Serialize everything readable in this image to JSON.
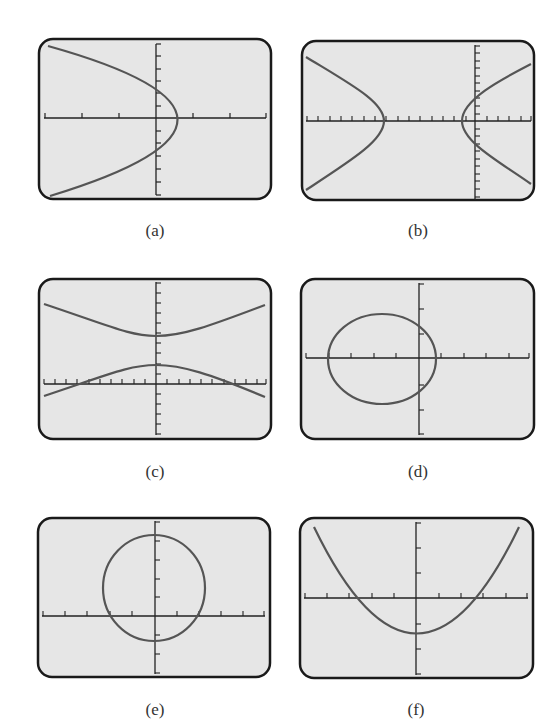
{
  "colors": {
    "screen_bg": "#e6e6e6",
    "frame": "#1a1a1a",
    "curve": "#555555",
    "axis": "#222222"
  },
  "panels": [
    {
      "id": "a",
      "label": "(a)",
      "shape": "parabola opening left",
      "frame": {
        "x": 38,
        "y": 38,
        "w": 234,
        "h": 162
      },
      "axis_origin": {
        "x": 156,
        "y": 118
      },
      "x_tick_spacing": 37,
      "y_tick_spacing": 12.3,
      "curve_path": "M 48 46 Q 306 118 48 196"
    },
    {
      "id": "b",
      "label": "(b)",
      "shape": "hyperbola opening left/right",
      "frame": {
        "x": 301,
        "y": 40,
        "w": 234,
        "h": 161
      },
      "axis_origin": {
        "x": 475,
        "y": 121
      },
      "x_tick_spacing": 11.4,
      "y_tick_spacing": 7.6,
      "curve_path": "M 306 57 C 350 85, 384 102, 384 121 C 384 140, 350 160, 306 190 M 531 64 C 500 80, 462 100, 462 121 C 462 142, 500 162, 531 184"
    },
    {
      "id": "c",
      "label": "(c)",
      "shape": "hyperbola opening up/down",
      "frame": {
        "x": 38,
        "y": 278,
        "w": 234,
        "h": 162
      },
      "axis_origin": {
        "x": 156,
        "y": 384
      },
      "x_tick_spacing": 11.3,
      "y_tick_spacing": 10,
      "curve_path": "M 44 304 C 110 326, 130 336, 156 336 C 182 336, 210 326, 265 305 M 44 396 C 110 374, 130 365, 156 365 C 182 365, 210 374, 265 397"
    },
    {
      "id": "d",
      "label": "(d)",
      "shape": "ellipse",
      "frame": {
        "x": 300,
        "y": 278,
        "w": 235,
        "h": 162
      },
      "axis_origin": {
        "x": 419,
        "y": 358
      },
      "x_tick_spacing": 22.5,
      "y_tick_spacing": 25.5,
      "ellipse": {
        "cx": 382,
        "cy": 359,
        "rx": 54,
        "ry": 45
      }
    },
    {
      "id": "e",
      "label": "(e)",
      "shape": "circle",
      "frame": {
        "x": 37,
        "y": 517,
        "w": 234,
        "h": 161
      },
      "axis_origin": {
        "x": 155,
        "y": 616
      },
      "x_tick_spacing": 22.3,
      "y_tick_spacing": 19,
      "ellipse": {
        "cx": 154,
        "cy": 588,
        "rx": 51,
        "ry": 53
      }
    },
    {
      "id": "f",
      "label": "(f)",
      "shape": "parabola opening up",
      "frame": {
        "x": 299,
        "y": 517,
        "w": 235,
        "h": 162
      },
      "axis_origin": {
        "x": 416,
        "y": 598
      },
      "x_tick_spacing": 22.5,
      "y_tick_spacing": 25.5,
      "curve_path": "M 314 527 Q 417 740 519 527"
    }
  ]
}
